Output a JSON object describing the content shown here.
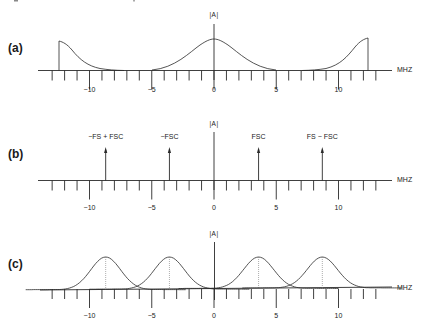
{
  "figure": {
    "x_unit": "MHZ",
    "amplitude_label": "|A|",
    "tick_labels": [
      {
        "value": -10,
        "text": "−10"
      },
      {
        "value": -5,
        "text": "−5"
      },
      {
        "value": 0,
        "text": "0"
      },
      {
        "value": 5,
        "text": "5"
      },
      {
        "value": 10,
        "text": "10"
      }
    ],
    "tick_range": [
      -13,
      13
    ],
    "tick_step": 1,
    "colors": {
      "line": "#2a2a2a",
      "background": "#ffffff"
    }
  },
  "panels": [
    {
      "id": "a",
      "label": "(a)",
      "description": "Baseband spectrum centered at 0 with images at edges",
      "shapes": [
        {
          "type": "bell",
          "center_mhz": 0
        },
        {
          "type": "half-bell-right-edge",
          "edge_mhz": -12.3
        },
        {
          "type": "half-bell-left-edge",
          "edge_mhz": 12.3
        }
      ]
    },
    {
      "id": "b",
      "label": "(b)",
      "description": "Sampling components (impulses)",
      "components": [
        {
          "label": "−FS + FSC",
          "position_mhz": -8.7
        },
        {
          "label": "−FSC",
          "position_mhz": -3.58
        },
        {
          "label": "FSC",
          "position_mhz": 3.58
        },
        {
          "label": "FS − FSC",
          "position_mhz": 8.7
        }
      ]
    },
    {
      "id": "c",
      "label": "(c)",
      "description": "Shifted spectra at component frequencies",
      "shapes": [
        {
          "type": "bell",
          "center_mhz": -8.7
        },
        {
          "type": "bell",
          "center_mhz": -3.58
        },
        {
          "type": "bell",
          "center_mhz": 3.58
        },
        {
          "type": "bell",
          "center_mhz": 8.7
        }
      ]
    }
  ]
}
